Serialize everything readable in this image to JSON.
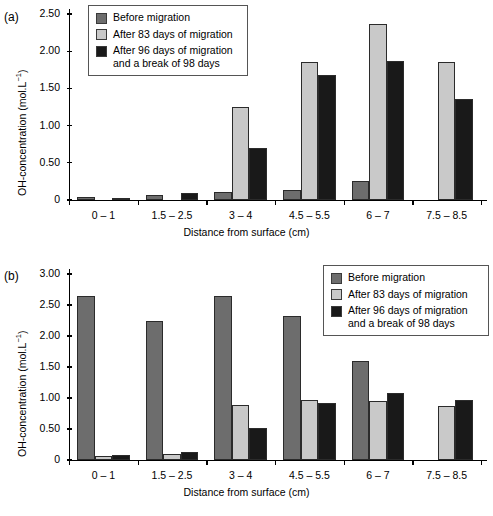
{
  "figure": {
    "panels": [
      {
        "tag": "(a)",
        "xlabel": "Distance from surface (cm)",
        "ylabel_main": "OH-concentration (mol.L",
        "ylabel_sup": "-1",
        "ylabel_tail": ")",
        "ylabel_full": "OH-concentration (mol.L-1)",
        "yticks": [
          "0",
          "0.50",
          "1.00",
          "1.50",
          "2.00",
          "2.50"
        ],
        "legend_position": "top-left"
      },
      {
        "tag": "(b)",
        "xlabel": "Distance from surface (cm)",
        "ylabel_main": "OH-concentration (mol.L",
        "ylabel_sup": "-1",
        "ylabel_tail": ")",
        "ylabel_full": "OH-concentration (mol.L-1)",
        "yticks": [
          "0",
          "0.50",
          "1.00",
          "1.50",
          "2.00",
          "2.50",
          "3.00"
        ],
        "legend_position": "top-right"
      }
    ],
    "legend": {
      "items": [
        {
          "label": "Before migration",
          "color": "#6d6d6d"
        },
        {
          "label": "After 83 days of migration",
          "color": "#c9c9c9"
        },
        {
          "label": "After 96 days of migration\nand a break of 98 days",
          "color": "#191919"
        }
      ]
    }
  },
  "chart_data": [
    {
      "type": "bar",
      "panel": "(a)",
      "title": "",
      "xlabel": "Distance from surface (cm)",
      "ylabel": "OH-concentration (mol.L-1)",
      "ylim": [
        0,
        2.5
      ],
      "yticks": [
        0,
        0.5,
        1.0,
        1.5,
        2.0,
        2.5
      ],
      "grid": false,
      "legend_position": "top-left",
      "categories": [
        "0 – 1",
        "1.5 – 2.5",
        "3 – 4",
        "4.5 – 5.5",
        "6 – 7",
        "7.5 – 8.5"
      ],
      "series": [
        {
          "name": "Before migration",
          "color": "#6d6d6d",
          "values": [
            0.04,
            0.07,
            0.11,
            0.14,
            0.26,
            null
          ]
        },
        {
          "name": "After 83 days of migration",
          "color": "#c9c9c9",
          "values": [
            null,
            null,
            1.25,
            1.86,
            2.36,
            1.85
          ]
        },
        {
          "name": "After 96 days of migration and a break of 98 days",
          "color": "#191919",
          "values": [
            0.02,
            0.1,
            0.7,
            1.68,
            1.87,
            1.36
          ]
        }
      ]
    },
    {
      "type": "bar",
      "panel": "(b)",
      "title": "",
      "xlabel": "Distance from surface (cm)",
      "ylabel": "OH-concentration (mol.L-1)",
      "ylim": [
        0,
        3.0
      ],
      "yticks": [
        0,
        0.5,
        1.0,
        1.5,
        2.0,
        2.5,
        3.0
      ],
      "grid": false,
      "legend_position": "top-right",
      "categories": [
        "0 – 1",
        "1.5 – 2.5",
        "3 – 4",
        "4.5 – 5.5",
        "6 – 7",
        "7.5 – 8.5"
      ],
      "series": [
        {
          "name": "Before migration",
          "color": "#6d6d6d",
          "values": [
            2.65,
            2.24,
            2.64,
            2.32,
            1.59,
            null
          ]
        },
        {
          "name": "After 83 days of migration",
          "color": "#c9c9c9",
          "values": [
            0.06,
            0.1,
            0.89,
            0.96,
            0.95,
            0.87
          ]
        },
        {
          "name": "After 96 days of migration and a break of 98 days",
          "color": "#191919",
          "values": [
            0.08,
            0.13,
            0.52,
            0.92,
            1.08,
            0.96
          ]
        }
      ]
    }
  ]
}
